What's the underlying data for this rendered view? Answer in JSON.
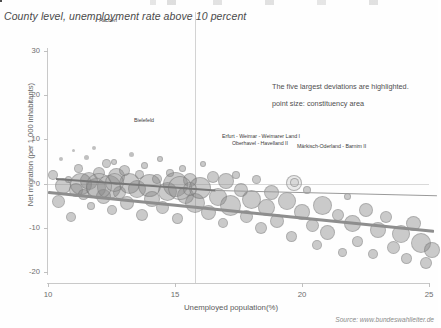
{
  "title": "County level, unemployment rate above 10 percent",
  "source": "Source: www.bundeswahlleiter.de",
  "annotations": {
    "line1": "The five largest deviations are highlighted.",
    "line2": "point size: constituency area"
  },
  "point_labels": {
    "aachen": "Aachen",
    "bielefeld": "Bielefeld",
    "erfurt": "Erfurt - Weimar - Weimarer Land I",
    "oberhavel": "Oberhavel - Havelland II",
    "maerkisch": "Märkisch-Oderland - Barnim II"
  },
  "chart_data": {
    "type": "scatter",
    "title": "County level, unemployment rate above 10 percent",
    "xlabel": "Unemployed population(%)",
    "ylabel": "Net migration (per 1,000 inhabitants)",
    "xlim": [
      9.3,
      25.9
    ],
    "ylim": [
      -22,
      32
    ],
    "xticks": [
      10,
      15,
      20,
      25
    ],
    "yticks": [
      30,
      20,
      10,
      0,
      -10,
      -20
    ],
    "grid": "vertical line at x=15.8, horizontal line at y=0",
    "legend": "none",
    "size_encoding": "point size: constituency area",
    "annotation_note": "The five largest deviations are highlighted.",
    "trend": {
      "type": "linear-fit",
      "x_start": 10.0,
      "y_start": -1.6,
      "x_end": 25.2,
      "y_end": -10.4
    },
    "highlighted_points": [
      {
        "label": "Aachen",
        "x": 12.1,
        "y": 33.0,
        "size": 4
      },
      {
        "label": "Bielefeld",
        "x": 13.9,
        "y": 12.2,
        "size": 6
      },
      {
        "label": "Erfurt - Weimar - Weimarer Land I",
        "x": 19.2,
        "y": 6.6,
        "size": 16
      },
      {
        "label": "Oberhavel - Havelland II",
        "x": 19.9,
        "y": 5.6,
        "size": 11
      },
      {
        "label": "Märkisch-Oderland - Barnim II",
        "x": 21.2,
        "y": 5.8,
        "size": 17
      }
    ],
    "points": [
      {
        "x": 10.2,
        "y": 2.0,
        "s": 10
      },
      {
        "x": 10.4,
        "y": -4.0,
        "s": 13
      },
      {
        "x": 10.5,
        "y": 5.5,
        "s": 4
      },
      {
        "x": 10.6,
        "y": -0.5,
        "s": 16
      },
      {
        "x": 10.8,
        "y": 1.0,
        "s": 7
      },
      {
        "x": 10.9,
        "y": -7.5,
        "s": 10
      },
      {
        "x": 11.0,
        "y": 7.5,
        "s": 3
      },
      {
        "x": 11.1,
        "y": -1.5,
        "s": 14
      },
      {
        "x": 11.2,
        "y": 3.5,
        "s": 9
      },
      {
        "x": 11.3,
        "y": -0.2,
        "s": 22
      },
      {
        "x": 11.4,
        "y": -2.5,
        "s": 11
      },
      {
        "x": 11.5,
        "y": 6.0,
        "s": 5
      },
      {
        "x": 11.6,
        "y": 0.5,
        "s": 18
      },
      {
        "x": 11.7,
        "y": -5.0,
        "s": 8
      },
      {
        "x": 11.8,
        "y": 8.0,
        "s": 4
      },
      {
        "x": 11.9,
        "y": -1.0,
        "s": 20
      },
      {
        "x": 12.0,
        "y": 2.5,
        "s": 12
      },
      {
        "x": 12.2,
        "y": -3.0,
        "s": 15
      },
      {
        "x": 12.3,
        "y": 4.5,
        "s": 9
      },
      {
        "x": 12.4,
        "y": -0.8,
        "s": 24
      },
      {
        "x": 12.5,
        "y": -6.0,
        "s": 10
      },
      {
        "x": 12.6,
        "y": 5.0,
        "s": 6
      },
      {
        "x": 12.7,
        "y": 1.5,
        "s": 17
      },
      {
        "x": 12.8,
        "y": -2.0,
        "s": 13
      },
      {
        "x": 13.0,
        "y": 3.0,
        "s": 11
      },
      {
        "x": 13.1,
        "y": -4.5,
        "s": 14
      },
      {
        "x": 13.2,
        "y": 0.0,
        "s": 21
      },
      {
        "x": 13.3,
        "y": 6.5,
        "s": 5
      },
      {
        "x": 13.5,
        "y": -1.2,
        "s": 18
      },
      {
        "x": 13.6,
        "y": 2.0,
        "s": 9
      },
      {
        "x": 13.7,
        "y": -7.0,
        "s": 12
      },
      {
        "x": 13.8,
        "y": 4.0,
        "s": 7
      },
      {
        "x": 14.0,
        "y": -0.5,
        "s": 23
      },
      {
        "x": 14.1,
        "y": -3.5,
        "s": 16
      },
      {
        "x": 14.3,
        "y": 1.0,
        "s": 10
      },
      {
        "x": 14.4,
        "y": 5.5,
        "s": 6
      },
      {
        "x": 14.5,
        "y": -5.5,
        "s": 13
      },
      {
        "x": 14.7,
        "y": -1.8,
        "s": 19
      },
      {
        "x": 14.8,
        "y": 2.5,
        "s": 8
      },
      {
        "x": 15.0,
        "y": -0.2,
        "s": 25
      },
      {
        "x": 15.1,
        "y": -8.0,
        "s": 11
      },
      {
        "x": 15.3,
        "y": 3.5,
        "s": 7
      },
      {
        "x": 15.4,
        "y": -2.8,
        "s": 17
      },
      {
        "x": 15.6,
        "y": 0.8,
        "s": 14
      },
      {
        "x": 15.8,
        "y": -4.5,
        "s": 20
      },
      {
        "x": 16.0,
        "y": -1.0,
        "s": 22
      },
      {
        "x": 16.1,
        "y": 4.5,
        "s": 6
      },
      {
        "x": 16.3,
        "y": -6.5,
        "s": 15
      },
      {
        "x": 16.5,
        "y": 1.5,
        "s": 12
      },
      {
        "x": 16.7,
        "y": -3.0,
        "s": 18
      },
      {
        "x": 16.9,
        "y": -9.0,
        "s": 10
      },
      {
        "x": 17.0,
        "y": 0.5,
        "s": 16
      },
      {
        "x": 17.2,
        "y": -5.0,
        "s": 21
      },
      {
        "x": 17.4,
        "y": 2.0,
        "s": 8
      },
      {
        "x": 17.6,
        "y": -1.5,
        "s": 14
      },
      {
        "x": 17.8,
        "y": -7.5,
        "s": 13
      },
      {
        "x": 18.0,
        "y": -3.5,
        "s": 19
      },
      {
        "x": 18.2,
        "y": 1.0,
        "s": 9
      },
      {
        "x": 18.4,
        "y": -10.0,
        "s": 12
      },
      {
        "x": 18.6,
        "y": -5.5,
        "s": 17
      },
      {
        "x": 18.8,
        "y": -2.0,
        "s": 15
      },
      {
        "x": 19.0,
        "y": -8.5,
        "s": 14
      },
      {
        "x": 19.4,
        "y": -4.0,
        "s": 18
      },
      {
        "x": 19.6,
        "y": -12.0,
        "s": 11
      },
      {
        "x": 20.0,
        "y": -6.5,
        "s": 16
      },
      {
        "x": 20.2,
        "y": -1.5,
        "s": 8
      },
      {
        "x": 20.4,
        "y": -9.5,
        "s": 13
      },
      {
        "x": 20.6,
        "y": -14.0,
        "s": 10
      },
      {
        "x": 20.8,
        "y": -5.0,
        "s": 19
      },
      {
        "x": 21.0,
        "y": -11.0,
        "s": 15
      },
      {
        "x": 21.4,
        "y": -7.0,
        "s": 12
      },
      {
        "x": 21.6,
        "y": -15.5,
        "s": 9
      },
      {
        "x": 21.8,
        "y": -3.0,
        "s": 7
      },
      {
        "x": 22.0,
        "y": -9.0,
        "s": 17
      },
      {
        "x": 22.2,
        "y": -13.0,
        "s": 11
      },
      {
        "x": 22.5,
        "y": -6.0,
        "s": 14
      },
      {
        "x": 22.8,
        "y": -16.0,
        "s": 10
      },
      {
        "x": 23.0,
        "y": -10.5,
        "s": 16
      },
      {
        "x": 23.3,
        "y": -7.5,
        "s": 12
      },
      {
        "x": 23.6,
        "y": -14.5,
        "s": 13
      },
      {
        "x": 23.9,
        "y": -11.5,
        "s": 18
      },
      {
        "x": 24.1,
        "y": -17.0,
        "s": 11
      },
      {
        "x": 24.4,
        "y": -9.0,
        "s": 15
      },
      {
        "x": 24.7,
        "y": -13.5,
        "s": 20
      },
      {
        "x": 24.9,
        "y": -18.0,
        "s": 12
      },
      {
        "x": 25.1,
        "y": -15.0,
        "s": 16
      }
    ]
  }
}
